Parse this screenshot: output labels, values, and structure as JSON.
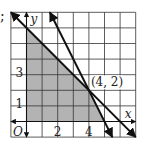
{
  "prefix_mark": ";",
  "chart_data": {
    "type": "line",
    "title": "",
    "xlabel": "x",
    "ylabel": "y",
    "origin_label": "O",
    "xlim": [
      -1,
      7
    ],
    "ylim": [
      -1,
      7
    ],
    "grid": true,
    "x_ticks": [
      {
        "value": 2,
        "label": "2"
      },
      {
        "value": 4,
        "label": "4"
      }
    ],
    "y_ticks": [
      {
        "value": 1,
        "label": "1"
      },
      {
        "value": 3,
        "label": "3"
      }
    ],
    "series": [
      {
        "name": "x + y = 6",
        "points": [
          [
            -1,
            7
          ],
          [
            7,
            -1
          ]
        ]
      },
      {
        "name": "2x + y = 10",
        "points": [
          [
            1.5,
            7
          ],
          [
            5.5,
            -1
          ]
        ]
      }
    ],
    "shaded_region": {
      "name": "feasible region",
      "vertices": [
        [
          0,
          0
        ],
        [
          0,
          6
        ],
        [
          4,
          2
        ],
        [
          5,
          0
        ]
      ],
      "color": "#b3b3b3"
    },
    "annotations": [
      {
        "text": "(4, 2)",
        "at": [
          4,
          2
        ]
      }
    ],
    "colors": {
      "grid": "#333333",
      "line": "#111111",
      "shade": "#b3b3b3"
    }
  }
}
